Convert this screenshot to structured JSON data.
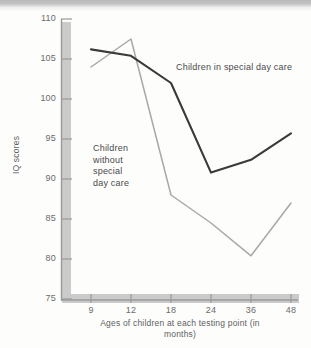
{
  "chart_data": {
    "type": "line",
    "title": "",
    "subtitle": "",
    "xlabel": "Ages of children at each\ntesting point (in months)",
    "ylabel": "IQ scores",
    "categories": [
      "9",
      "12",
      "18",
      "24",
      "36",
      "48"
    ],
    "x_tick_labels": [
      "9",
      "12",
      "18",
      "24",
      "36",
      "48"
    ],
    "y_tick_labels": [
      "75",
      "80",
      "85",
      "90",
      "95",
      "100",
      "105",
      "110"
    ],
    "y_ticks": [
      75,
      80,
      85,
      90,
      95,
      100,
      105,
      110
    ],
    "ylim": [
      75,
      110
    ],
    "grid": false,
    "legend": "annotations-inline",
    "series": [
      {
        "name": "Children in special day care",
        "color": "#3a3a3a",
        "values": [
          106.2,
          105.4,
          102.0,
          90.8,
          92.4,
          95.7
        ]
      },
      {
        "name": "Children without special day care",
        "color": "#a8a8a8",
        "values": [
          104.0,
          107.5,
          88.0,
          84.5,
          80.4,
          87.0
        ]
      }
    ],
    "annotations": [
      {
        "name": "special-day-care-label",
        "text": "Children in special day care",
        "series": "Children in special day care"
      },
      {
        "name": "without-special-day-care-label",
        "text": "Children\nwithout\nspecial\nday care",
        "series": "Children without special day care"
      }
    ]
  },
  "colors": {
    "series_dark": "#3a3a3a",
    "series_light": "#a8a8a8",
    "axis": "#9a9a9a",
    "shadow": "#c9c9c9",
    "text": "#5e5e5e",
    "background": "#fdfdfc"
  }
}
